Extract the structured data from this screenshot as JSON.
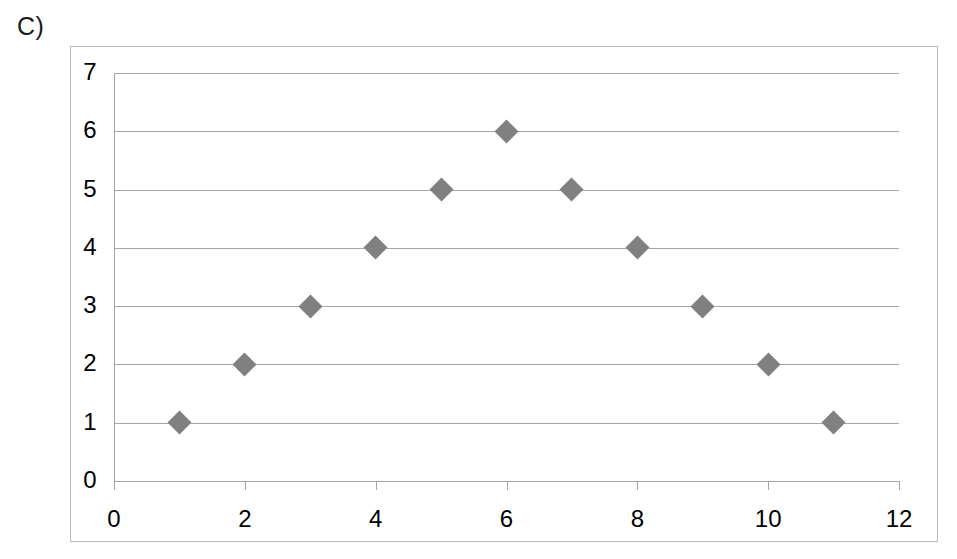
{
  "panel": {
    "label": "C)"
  },
  "colors": {
    "marker": "#808080",
    "gridline": "#a6a6a6",
    "frame_border": "#b9b9b9",
    "text": "#000000",
    "background": "#ffffff"
  },
  "chart_data": {
    "type": "scatter",
    "title": "",
    "subtitle": "",
    "xlabel": "",
    "ylabel": "",
    "xlim": [
      0,
      12
    ],
    "ylim": [
      0,
      7
    ],
    "x_ticks": [
      0,
      2,
      4,
      6,
      8,
      10,
      12
    ],
    "y_ticks": [
      0,
      1,
      2,
      3,
      4,
      5,
      6,
      7
    ],
    "x_tick_labels": [
      "0",
      "2",
      "4",
      "6",
      "8",
      "10",
      "12"
    ],
    "y_tick_labels": [
      "0",
      "1",
      "2",
      "3",
      "4",
      "5",
      "6",
      "7"
    ],
    "grid": {
      "horizontal": true,
      "vertical": false
    },
    "legend": {
      "visible": false,
      "position": "none",
      "entries": []
    },
    "marker": {
      "shape": "diamond",
      "color": "#808080",
      "size": 17
    },
    "series": [
      {
        "name": "Series 1",
        "points": [
          {
            "x": 1,
            "y": 1
          },
          {
            "x": 2,
            "y": 2
          },
          {
            "x": 3,
            "y": 3
          },
          {
            "x": 4,
            "y": 4
          },
          {
            "x": 5,
            "y": 5
          },
          {
            "x": 6,
            "y": 6
          },
          {
            "x": 7,
            "y": 5
          },
          {
            "x": 8,
            "y": 4
          },
          {
            "x": 9,
            "y": 3
          },
          {
            "x": 10,
            "y": 2
          },
          {
            "x": 11,
            "y": 1
          }
        ]
      }
    ],
    "annotations": []
  }
}
